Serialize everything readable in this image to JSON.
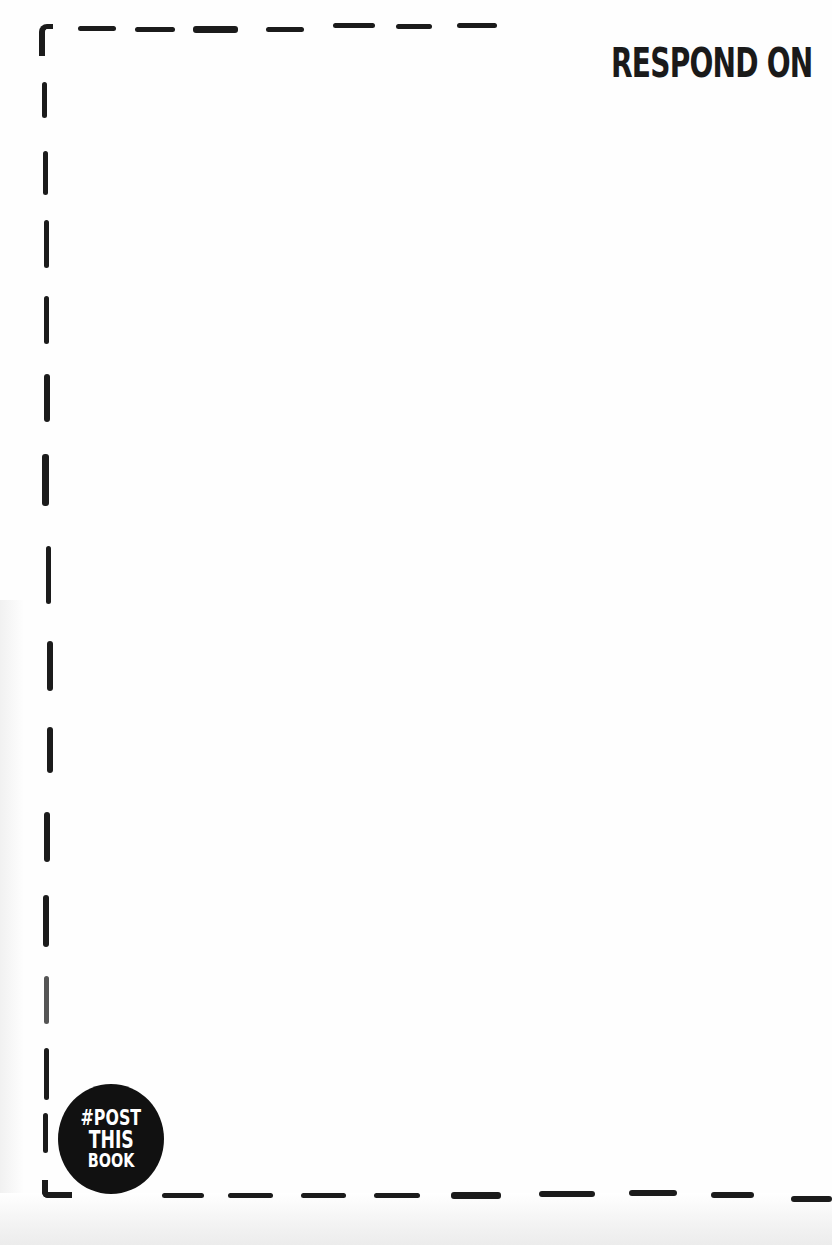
{
  "page": {
    "heading": "RESPOND ON",
    "badge": {
      "line1": "#POST",
      "line2": "THIS",
      "line3": "BOOK"
    },
    "frame": {
      "style": "hand-drawn dashed border",
      "color": "#1b1b1b"
    },
    "background_color": "#fefefe"
  }
}
